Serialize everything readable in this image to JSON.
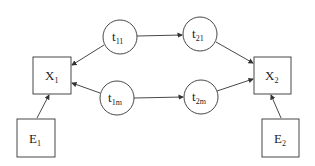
{
  "diagram": {
    "nodes": [
      {
        "id": "X1",
        "main": "X",
        "sub": "1",
        "shape": "box"
      },
      {
        "id": "X2",
        "main": "X",
        "sub": "2",
        "shape": "box"
      },
      {
        "id": "E1",
        "main": "E",
        "sub": "1",
        "shape": "box"
      },
      {
        "id": "E2",
        "main": "E",
        "sub": "2",
        "shape": "box"
      },
      {
        "id": "t11",
        "main": "t",
        "sub": "11",
        "shape": "circle"
      },
      {
        "id": "t21",
        "main": "t",
        "sub": "21",
        "shape": "circle"
      },
      {
        "id": "t1m",
        "main": "t",
        "sub": "1m",
        "shape": "circle"
      },
      {
        "id": "t2m",
        "main": "t",
        "sub": "2m",
        "shape": "circle"
      }
    ],
    "edges": [
      {
        "from": "t11",
        "to": "X1"
      },
      {
        "from": "t11",
        "to": "t21"
      },
      {
        "from": "t21",
        "to": "X2"
      },
      {
        "from": "t1m",
        "to": "X1"
      },
      {
        "from": "t1m",
        "to": "t2m"
      },
      {
        "from": "t2m",
        "to": "X2"
      },
      {
        "from": "E1",
        "to": "X1"
      },
      {
        "from": "E2",
        "to": "X2"
      }
    ],
    "colors": {
      "stroke": "#333333",
      "background": "#ffffff"
    }
  }
}
